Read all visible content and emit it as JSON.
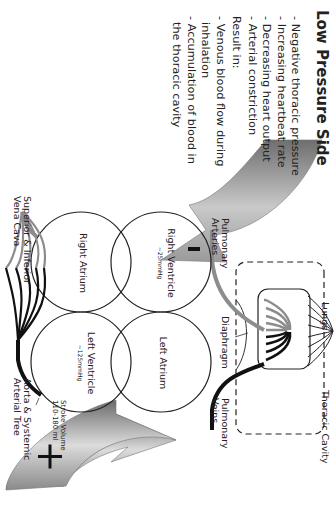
{
  "title": "Low Pressure Side",
  "conditions": [
    "- Negative thoracic pressure",
    "- Increasing heartbeat rate",
    "- Decreasing heart output",
    "- Arterial constriction"
  ],
  "result_heading": "Result in:",
  "results": [
    "- Venous blood flow during",
    "  inhalation",
    "- Accumulation of blood in",
    "  the thoracic cavity"
  ],
  "arrows": {
    "top_sign": "−",
    "bottom_sign": "+"
  },
  "chambers": {
    "right_ventricle": {
      "name": "Right Ventricle",
      "pressure": "~25mmHg"
    },
    "right_atrium": {
      "name": "Right Atrium"
    },
    "left_ventricle": {
      "name": "Left Ventricle",
      "pressure": "~125mmHg"
    },
    "left_atrium": {
      "name": "Left Atrium"
    }
  },
  "labels": {
    "pulmonary_arteries_1": "Pulmonary",
    "pulmonary_arteries_2": "Arteries",
    "pulmonary_veins_1": "Pulmonary",
    "pulmonary_veins_2": "Veins",
    "lungs": "Lungs",
    "diaphragm": "Diaphragm",
    "thoracic_cavity": "Thoracic Cavity",
    "vena_cava_1": "Superior & Inferior",
    "vena_cava_2": "Vena Cava",
    "aorta_1": "Aorta & Systemic",
    "aorta_2": "Arterial Tree",
    "stroke_volume_1": "Stroke Volume",
    "stroke_volume_2": "110-180 ml"
  },
  "colors": {
    "venous": "#8c8c8c",
    "arterial": "#111111",
    "arrow_light": "#e2e2e2",
    "arrow_dark": "#6e6e6e"
  }
}
